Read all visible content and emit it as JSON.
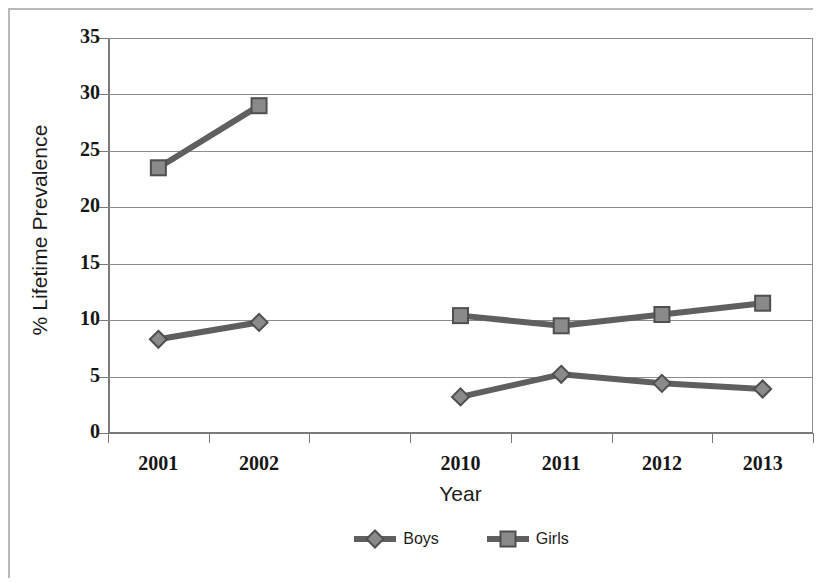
{
  "chart_data": {
    "type": "line",
    "title": "",
    "xlabel": "Year",
    "ylabel": "% Lifetime Prevalence",
    "categories": [
      "2001",
      "2002",
      "",
      "2010",
      "2011",
      "2012",
      "2013"
    ],
    "ylim": [
      0,
      35
    ],
    "ytick_step": 5,
    "yticks": [
      "0",
      "5",
      "10",
      "15",
      "20",
      "25",
      "30",
      "35"
    ],
    "grid": true,
    "legend_position": "bottom",
    "series": [
      {
        "name": "Boys",
        "marker": "diamond",
        "color": "#5f5f5f",
        "values": [
          8.3,
          9.8,
          null,
          3.2,
          5.2,
          4.4,
          3.9
        ]
      },
      {
        "name": "Girls",
        "marker": "square",
        "color": "#6b6b6b",
        "values": [
          23.5,
          29.0,
          null,
          10.4,
          9.5,
          10.5,
          11.5
        ]
      }
    ]
  },
  "legend": {
    "items": [
      {
        "label": "Boys",
        "marker": "diamond"
      },
      {
        "label": "Girls",
        "marker": "square"
      }
    ]
  },
  "colors": {
    "series_line": "#5f5f5f",
    "marker_fill": "#8a8a8a",
    "marker_stroke": "#4f4f4f",
    "gridline": "#8c8c8c",
    "axis": "#7a7a7a",
    "text": "#161616",
    "page_border": "#b9b9b9"
  }
}
